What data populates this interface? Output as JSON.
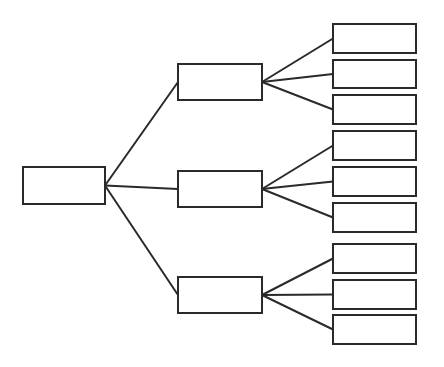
{
  "diagram": {
    "type": "tree",
    "style": "hand-drawn",
    "stroke_color": "#2a2a2a",
    "background": "#ffffff",
    "root": {
      "id": "root",
      "label": "",
      "box": [
        23,
        167,
        82,
        37
      ]
    },
    "level1": [
      {
        "id": "n1",
        "label": "",
        "box": [
          178,
          64,
          84,
          36
        ]
      },
      {
        "id": "n2",
        "label": "",
        "box": [
          178,
          171,
          84,
          36
        ]
      },
      {
        "id": "n3",
        "label": "",
        "box": [
          178,
          277,
          84,
          36
        ]
      }
    ],
    "level2": [
      {
        "id": "n1a",
        "parent": "n1",
        "label": "",
        "box": [
          333,
          24,
          83,
          29
        ]
      },
      {
        "id": "n1b",
        "parent": "n1",
        "label": "",
        "box": [
          333,
          60,
          83,
          28
        ]
      },
      {
        "id": "n1c",
        "parent": "n1",
        "label": "",
        "box": [
          333,
          95,
          83,
          29
        ]
      },
      {
        "id": "n2a",
        "parent": "n2",
        "label": "",
        "box": [
          333,
          131,
          83,
          29
        ]
      },
      {
        "id": "n2b",
        "parent": "n2",
        "label": "",
        "box": [
          333,
          167,
          83,
          29
        ]
      },
      {
        "id": "n2c",
        "parent": "n2",
        "label": "",
        "box": [
          333,
          203,
          83,
          29
        ]
      },
      {
        "id": "n3a",
        "parent": "n3",
        "label": "",
        "box": [
          333,
          244,
          83,
          29
        ]
      },
      {
        "id": "n3b",
        "parent": "n3",
        "label": "",
        "box": [
          333,
          280,
          83,
          29
        ]
      },
      {
        "id": "n3c",
        "parent": "n3",
        "label": "",
        "box": [
          333,
          315,
          83,
          29
        ]
      }
    ]
  }
}
